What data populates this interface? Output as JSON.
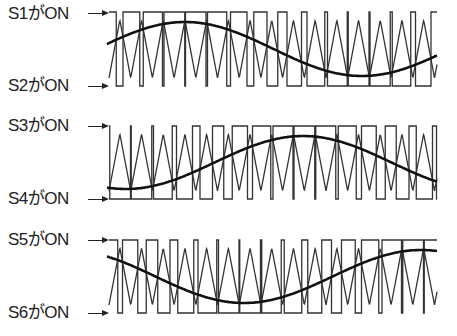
{
  "diagram": {
    "title": "",
    "carrier": {
      "type": "triangle",
      "period_px": 21.7,
      "start_x": 109,
      "end_x": 437,
      "starts_at": "valley"
    },
    "reference": {
      "type": "sine",
      "period_px": 354
    },
    "panels": [
      {
        "id": "phase-u",
        "top_label": "S1がON",
        "bottom_label": "S2がON",
        "sine_peak_x": 185,
        "pwm_levels": [
          "high",
          "low"
        ]
      },
      {
        "id": "phase-v",
        "top_label": "S3がON",
        "bottom_label": "S4がON",
        "sine_peak_x": 303,
        "pwm_levels": [
          "high",
          "low"
        ]
      },
      {
        "id": "phase-w",
        "top_label": "S5がON",
        "bottom_label": "S6がON",
        "sine_peak_x": 421,
        "pwm_levels": [
          "high",
          "low"
        ]
      }
    ]
  }
}
